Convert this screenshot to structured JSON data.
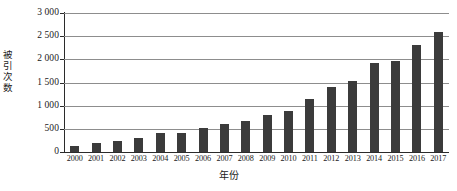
{
  "chart_data": {
    "type": "bar",
    "title": "",
    "xlabel": "年份",
    "ylabel": "被引次数",
    "categories": [
      "2000",
      "2001",
      "2002",
      "2003",
      "2004",
      "2005",
      "2006",
      "2007",
      "2008",
      "2009",
      "2010",
      "2011",
      "2012",
      "2013",
      "2014",
      "2015",
      "2016",
      "2017"
    ],
    "values": [
      130,
      190,
      240,
      305,
      415,
      410,
      510,
      605,
      665,
      805,
      880,
      1155,
      1395,
      1525,
      1915,
      1960,
      2305,
      2580
    ],
    "series": [
      {
        "name": "被引次数",
        "values": [
          130,
          190,
          240,
          305,
          415,
          410,
          510,
          605,
          665,
          805,
          880,
          1155,
          1395,
          1525,
          1915,
          1960,
          2305,
          2580
        ]
      }
    ],
    "ylim": [
      0,
      3000
    ],
    "yticks": [
      0,
      500,
      1000,
      1500,
      2000,
      2500,
      3000
    ],
    "ytick_labels": [
      "0",
      "500",
      "1 000",
      "1 500",
      "2 000",
      "2 500",
      "3 000"
    ],
    "grid": true,
    "legend": false,
    "legend_position": "none",
    "bar_color": "#3b3b3b",
    "gridline_color": "#8d8d8d",
    "axis_color": "#2b2b2b",
    "background_color": "#ffffff"
  }
}
